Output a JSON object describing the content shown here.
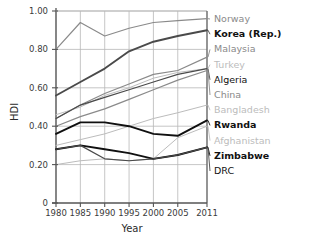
{
  "chart_data": {
    "type": "line",
    "title": "",
    "xlabel": "Year",
    "ylabel": "HDI",
    "xlim": [
      1980,
      2011
    ],
    "ylim": [
      0,
      1.0
    ],
    "grid": true,
    "legend_position": "right-outside",
    "x": [
      1980,
      1985,
      1990,
      1995,
      2000,
      2005,
      2011
    ],
    "xticklabels": [
      "1980",
      "1985",
      "1990",
      "1995",
      "2000",
      "2005",
      "2011"
    ],
    "yticks": [
      0,
      0.2,
      0.4,
      0.6,
      0.8,
      1.0
    ],
    "yticklabels": [
      "0",
      "0.20",
      "0.40",
      "0.60",
      "0.80",
      "1.00"
    ],
    "series": [
      {
        "name": "Norway",
        "values": [
          0.8,
          0.94,
          0.87,
          0.91,
          0.94,
          0.95,
          0.96
        ],
        "style": "gray",
        "weight": "normal"
      },
      {
        "name": "Korea (Rep.)",
        "values": [
          0.56,
          0.63,
          0.7,
          0.79,
          0.84,
          0.87,
          0.9
        ],
        "style": "dark",
        "weight": "bold"
      },
      {
        "name": "Malaysia",
        "values": [
          0.44,
          0.51,
          0.57,
          0.62,
          0.67,
          0.69,
          0.76
        ],
        "style": "gray",
        "weight": "normal"
      },
      {
        "name": "Turkey",
        "values": [
          0.46,
          0.5,
          0.56,
          0.6,
          0.65,
          0.68,
          0.7
        ],
        "style": "light",
        "weight": "normal"
      },
      {
        "name": "Algeria",
        "values": [
          0.44,
          0.51,
          0.55,
          0.59,
          0.63,
          0.67,
          0.7
        ],
        "style": "dark",
        "weight": "normal"
      },
      {
        "name": "China",
        "values": [
          0.4,
          0.45,
          0.49,
          0.54,
          0.59,
          0.64,
          0.69
        ],
        "style": "gray",
        "weight": "normal"
      },
      {
        "name": "Bangladesh",
        "values": [
          0.3,
          0.33,
          0.36,
          0.4,
          0.44,
          0.47,
          0.51
        ],
        "style": "light",
        "weight": "normal"
      },
      {
        "name": "Rwanda",
        "values": [
          0.36,
          0.42,
          0.42,
          0.4,
          0.36,
          0.35,
          0.43
        ],
        "style": "black",
        "weight": "bold"
      },
      {
        "name": "Afghanistan",
        "values": [
          0.2,
          0.22,
          0.23,
          0.22,
          0.23,
          0.34,
          0.4
        ],
        "style": "light",
        "weight": "normal"
      },
      {
        "name": "Zimbabwe",
        "values": [
          0.28,
          0.3,
          0.28,
          0.26,
          0.23,
          0.25,
          0.29
        ],
        "style": "black",
        "weight": "bold"
      },
      {
        "name": "DRC",
        "values": [
          0.28,
          0.3,
          0.23,
          0.22,
          0.23,
          0.25,
          0.29
        ],
        "style": "dark",
        "weight": "normal"
      }
    ],
    "colors": {
      "black": "#101010",
      "dark": "#4a4a4a",
      "gray": "#8a8a8a",
      "light": "#bcbcbc",
      "axis": "#555555",
      "grid": "#b8b8b8"
    }
  },
  "axes": {
    "ylabel": "HDI",
    "xlabel": "Year"
  }
}
